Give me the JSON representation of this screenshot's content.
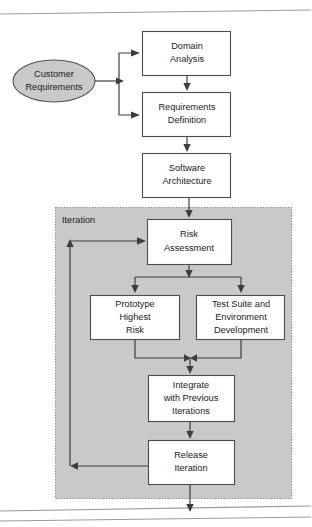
{
  "diagram": {
    "colors": {
      "node_fill": "#ffffff",
      "node_stroke": "#4d4d4d",
      "start_fill": "#c9c9c9",
      "region_fill": "#c9c9c9",
      "region_stroke": "#8a8a8a",
      "edge": "#3d3d3d",
      "rule": "#9a9a9a",
      "text": "#1a1a1a",
      "background": "#ffffff"
    },
    "region": {
      "label": "Iteration",
      "label_x": 53,
      "label_y": 220,
      "x": 55,
      "y": 207,
      "width": 236,
      "height": 291
    },
    "nodes": [
      {
        "id": "customer-requirements",
        "shape": "ellipse",
        "lines": [
          "Customer",
          "Requirements"
        ],
        "cx": 54,
        "cy": 81,
        "rx": 41,
        "ry": 21
      },
      {
        "id": "domain-analysis",
        "shape": "rect",
        "lines": [
          "Domain",
          "Analysis"
        ],
        "x": 142,
        "y": 31,
        "width": 89,
        "height": 45
      },
      {
        "id": "requirements-definition",
        "shape": "rect",
        "lines": [
          "Requirements",
          "Definition"
        ],
        "x": 142,
        "y": 92,
        "width": 89,
        "height": 45
      },
      {
        "id": "software-architecture",
        "shape": "rect",
        "lines": [
          "Software",
          "Architecture"
        ],
        "x": 142,
        "y": 153,
        "width": 89,
        "height": 45
      },
      {
        "id": "risk-assessment",
        "shape": "rect",
        "lines": [
          "Risk",
          "Assessment"
        ],
        "x": 147,
        "y": 219,
        "width": 85,
        "height": 46
      },
      {
        "id": "prototype-highest-risk",
        "shape": "rect",
        "lines": [
          "Prototype",
          "Highest",
          "Risk"
        ],
        "x": 90,
        "y": 295,
        "width": 90,
        "height": 45
      },
      {
        "id": "test-suite-environment-development",
        "shape": "rect",
        "lines": [
          "Test Suite and",
          "Environment",
          "Development"
        ],
        "x": 196,
        "y": 295,
        "width": 89,
        "height": 45
      },
      {
        "id": "integrate-with-previous-iterations",
        "shape": "rect",
        "lines": [
          "Integrate",
          "with Previous",
          "Iterations"
        ],
        "x": 148,
        "y": 375,
        "width": 87,
        "height": 47
      },
      {
        "id": "release-iteration",
        "shape": "rect",
        "lines": [
          "Release",
          "Iteration"
        ],
        "x": 148,
        "y": 440,
        "width": 87,
        "height": 45
      }
    ],
    "edges": [
      {
        "id": "edge-requirements-to-domain-analysis",
        "from": "customer-requirements",
        "to": "domain-analysis"
      },
      {
        "id": "edge-requirements-to-requirements-definition",
        "from": "customer-requirements",
        "to": "requirements-definition"
      },
      {
        "id": "edge-domain-analysis-to-requirements-definition",
        "from": "domain-analysis",
        "to": "requirements-definition"
      },
      {
        "id": "edge-requirements-definition-to-software-architecture",
        "from": "requirements-definition",
        "to": "software-architecture"
      },
      {
        "id": "edge-software-architecture-to-risk-assessment",
        "from": "software-architecture",
        "to": "risk-assessment"
      },
      {
        "id": "edge-risk-assessment-to-prototype",
        "from": "risk-assessment",
        "to": "prototype-highest-risk"
      },
      {
        "id": "edge-risk-assessment-to-test-suite",
        "from": "risk-assessment",
        "to": "test-suite-environment-development"
      },
      {
        "id": "edge-prototype-to-integrate",
        "from": "prototype-highest-risk",
        "to": "integrate-with-previous-iterations"
      },
      {
        "id": "edge-test-suite-to-integrate",
        "from": "test-suite-environment-development",
        "to": "integrate-with-previous-iterations"
      },
      {
        "id": "edge-integrate-to-release",
        "from": "integrate-with-previous-iterations",
        "to": "release-iteration"
      },
      {
        "id": "edge-release-feedback-to-risk-assessment",
        "from": "release-iteration",
        "to": "risk-assessment"
      },
      {
        "id": "edge-release-to-exit",
        "from": "release-iteration",
        "to": "exit"
      }
    ]
  }
}
